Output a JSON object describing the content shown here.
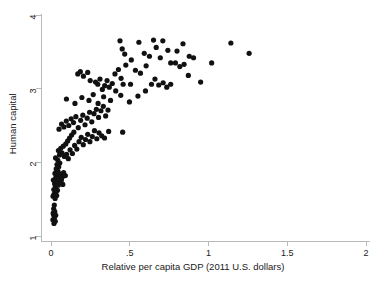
{
  "chart_data": {
    "type": "scatter",
    "title": "",
    "xlabel": "Relative per capita GDP (2011 U.S. dollars)",
    "ylabel": "Human capital",
    "xlim": [
      -0.06,
      2.06
    ],
    "ylim": [
      0.93,
      4.06
    ],
    "xticks": [
      "0",
      ".5",
      "1",
      "1.5",
      "2"
    ],
    "xtick_values": [
      0,
      0.5,
      1,
      1.5,
      2
    ],
    "yticks": [
      "1",
      "2",
      "3",
      "4"
    ],
    "ytick_values": [
      1,
      2,
      3,
      4
    ],
    "grid": false,
    "legend": "none",
    "marker": {
      "shape": "circle",
      "color": "#111111",
      "size_px": 5.2
    },
    "axis_color": "#b9b9b9",
    "series": [
      {
        "name": "Countries",
        "points": [
          [
            0.012,
            1.22
          ],
          [
            0.016,
            1.29
          ],
          [
            0.019,
            1.17
          ],
          [
            0.022,
            1.25
          ],
          [
            0.024,
            1.33
          ],
          [
            0.017,
            1.37
          ],
          [
            0.027,
            1.2
          ],
          [
            0.014,
            1.31
          ],
          [
            0.021,
            1.42
          ],
          [
            0.03,
            1.28
          ],
          [
            0.013,
            1.54
          ],
          [
            0.02,
            1.57
          ],
          [
            0.026,
            1.51
          ],
          [
            0.032,
            1.6
          ],
          [
            0.018,
            1.63
          ],
          [
            0.036,
            1.55
          ],
          [
            0.028,
            1.67
          ],
          [
            0.041,
            1.62
          ],
          [
            0.023,
            1.71
          ],
          [
            0.034,
            1.74
          ],
          [
            0.046,
            1.69
          ],
          [
            0.015,
            1.76
          ],
          [
            0.03,
            1.79
          ],
          [
            0.052,
            1.72
          ],
          [
            0.039,
            1.82
          ],
          [
            0.025,
            1.85
          ],
          [
            0.057,
            1.78
          ],
          [
            0.044,
            1.88
          ],
          [
            0.033,
            1.91
          ],
          [
            0.063,
            1.84
          ],
          [
            0.071,
            1.8
          ],
          [
            0.049,
            1.94
          ],
          [
            0.038,
            1.97
          ],
          [
            0.08,
            1.86
          ],
          [
            0.056,
            1.99
          ],
          [
            0.091,
            1.82
          ],
          [
            0.066,
            1.76
          ],
          [
            0.075,
            1.7
          ],
          [
            0.043,
            2.03
          ],
          [
            0.029,
            2.06
          ],
          [
            0.054,
            2.1
          ],
          [
            0.069,
            2.13
          ],
          [
            0.085,
            2.08
          ],
          [
            0.047,
            2.16
          ],
          [
            0.099,
            2.11
          ],
          [
            0.062,
            2.19
          ],
          [
            0.11,
            2.05
          ],
          [
            0.078,
            2.22
          ],
          [
            0.121,
            2.17
          ],
          [
            0.094,
            2.25
          ],
          [
            0.136,
            2.12
          ],
          [
            0.106,
            2.29
          ],
          [
            0.15,
            2.23
          ],
          [
            0.118,
            2.33
          ],
          [
            0.164,
            2.18
          ],
          [
            0.131,
            2.37
          ],
          [
            0.178,
            2.28
          ],
          [
            0.145,
            2.41
          ],
          [
            0.192,
            2.34
          ],
          [
            0.205,
            2.24
          ],
          [
            0.219,
            2.31
          ],
          [
            0.233,
            2.38
          ],
          [
            0.247,
            2.28
          ],
          [
            0.262,
            2.35
          ],
          [
            0.276,
            2.43
          ],
          [
            0.291,
            2.32
          ],
          [
            0.305,
            2.4
          ],
          [
            0.322,
            2.36
          ],
          [
            0.34,
            2.33
          ],
          [
            0.366,
            2.42
          ],
          [
            0.455,
            2.41
          ],
          [
            0.051,
            2.45
          ],
          [
            0.067,
            2.52
          ],
          [
            0.082,
            2.48
          ],
          [
            0.097,
            2.56
          ],
          [
            0.113,
            2.5
          ],
          [
            0.128,
            2.59
          ],
          [
            0.143,
            2.54
          ],
          [
            0.158,
            2.62
          ],
          [
            0.173,
            2.47
          ],
          [
            0.188,
            2.57
          ],
          [
            0.202,
            2.64
          ],
          [
            0.216,
            2.51
          ],
          [
            0.23,
            2.6
          ],
          [
            0.245,
            2.68
          ],
          [
            0.259,
            2.55
          ],
          [
            0.273,
            2.66
          ],
          [
            0.288,
            2.72
          ],
          [
            0.302,
            2.61
          ],
          [
            0.317,
            2.7
          ],
          [
            0.332,
            2.76
          ],
          [
            0.347,
            2.63
          ],
          [
            0.362,
            2.71
          ],
          [
            0.098,
            2.86
          ],
          [
            0.152,
            2.8
          ],
          [
            0.196,
            2.88
          ],
          [
            0.241,
            2.84
          ],
          [
            0.268,
            2.92
          ],
          [
            0.299,
            2.8
          ],
          [
            0.334,
            2.89
          ],
          [
            0.378,
            2.84
          ],
          [
            0.411,
            2.97
          ],
          [
            0.443,
            2.91
          ],
          [
            0.498,
            2.82
          ],
          [
            0.552,
            2.9
          ],
          [
            0.6,
            2.97
          ],
          [
            0.17,
            3.2
          ],
          [
            0.186,
            3.23
          ],
          [
            0.206,
            3.17
          ],
          [
            0.233,
            3.22
          ],
          [
            0.249,
            3.11
          ],
          [
            0.283,
            3.09
          ],
          [
            0.297,
            3.06
          ],
          [
            0.311,
            3.13
          ],
          [
            0.326,
            2.99
          ],
          [
            0.341,
            3.04
          ],
          [
            0.356,
            3.11
          ],
          [
            0.37,
            3.02
          ],
          [
            0.389,
            3.07
          ],
          [
            0.406,
            3.2
          ],
          [
            0.428,
            3.26
          ],
          [
            0.445,
            3.14
          ],
          [
            0.458,
            3.06
          ],
          [
            0.475,
            3.32
          ],
          [
            0.505,
            3.06
          ],
          [
            0.536,
            3.25
          ],
          [
            0.568,
            3.21
          ],
          [
            0.604,
            3.31
          ],
          [
            0.638,
            3.06
          ],
          [
            0.66,
            3.13
          ],
          [
            0.684,
            3.05
          ],
          [
            0.712,
            3.08
          ],
          [
            0.735,
            3.02
          ],
          [
            0.76,
            3.06
          ],
          [
            0.79,
            3.35
          ],
          [
            0.818,
            3.3
          ],
          [
            0.845,
            3.33
          ],
          [
            0.872,
            3.18
          ],
          [
            0.905,
            3.42
          ],
          [
            0.95,
            3.09
          ],
          [
            1.02,
            3.35
          ],
          [
            0.438,
            3.65
          ],
          [
            0.452,
            3.54
          ],
          [
            0.468,
            3.47
          ],
          [
            0.51,
            3.39
          ],
          [
            0.558,
            3.63
          ],
          [
            0.592,
            3.48
          ],
          [
            0.625,
            3.44
          ],
          [
            0.651,
            3.66
          ],
          [
            0.668,
            3.56
          ],
          [
            0.694,
            3.42
          ],
          [
            0.71,
            3.65
          ],
          [
            0.742,
            3.52
          ],
          [
            0.76,
            3.35
          ],
          [
            0.8,
            3.51
          ],
          [
            0.838,
            3.61
          ],
          [
            0.878,
            3.44
          ],
          [
            1.142,
            3.62
          ],
          [
            1.258,
            3.48
          ]
        ]
      }
    ]
  },
  "axes": {
    "x_title": "Relative per capita GDP (2011 U.S. dollars)",
    "y_title": "Human capital",
    "x_tick_labels": [
      "0",
      ".5",
      "1",
      "1.5",
      "2"
    ],
    "y_tick_labels": [
      "1",
      "2",
      "3",
      "4"
    ]
  },
  "title_remnant": ""
}
